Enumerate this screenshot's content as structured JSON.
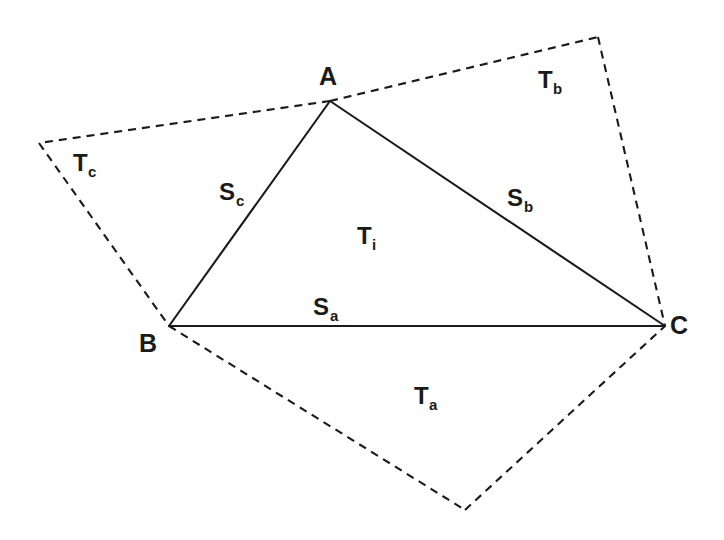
{
  "figure": {
    "background_color": "#ffffff",
    "stroke_color": "#1a1a1a",
    "width": 724,
    "height": 540
  },
  "vertices": [
    {
      "id": "A",
      "label": "A",
      "x": 330,
      "y": 101,
      "label_x": 328,
      "label_y": 85
    },
    {
      "id": "B",
      "label": "B",
      "x": 169,
      "y": 326,
      "label_x": 148,
      "label_y": 352
    },
    {
      "id": "C",
      "label": "C",
      "x": 665,
      "y": 326,
      "label_x": 679,
      "label_y": 334
    }
  ],
  "outer_points": [
    {
      "id": "P_left",
      "x": 39,
      "y": 143
    },
    {
      "id": "P_top_right",
      "x": 598,
      "y": 37
    },
    {
      "id": "P_bottom",
      "x": 465,
      "y": 510
    }
  ],
  "side_labels": [
    {
      "id": "S_a",
      "main": "S",
      "sub": "a",
      "x": 313,
      "y": 315,
      "describes": "edge B to C"
    },
    {
      "id": "S_b",
      "main": "S",
      "sub": "b",
      "x": 507,
      "y": 206,
      "describes": "edge A to C"
    },
    {
      "id": "S_c",
      "main": "S",
      "sub": "c",
      "x": 219,
      "y": 200,
      "describes": "edge A to B"
    }
  ],
  "region_labels": [
    {
      "id": "T_i",
      "main": "T",
      "sub": "i",
      "x": 357,
      "y": 244,
      "describes": "interior triangle ABC"
    },
    {
      "id": "T_a",
      "main": "T",
      "sub": "a",
      "x": 414,
      "y": 404,
      "describes": "exterior region below side a"
    },
    {
      "id": "T_b",
      "main": "T",
      "sub": "b",
      "x": 538,
      "y": 88,
      "describes": "exterior region beyond side b"
    },
    {
      "id": "T_c",
      "main": "T",
      "sub": "c",
      "x": 73,
      "y": 171,
      "describes": "exterior region beyond side c"
    }
  ],
  "solid_paths": [
    {
      "id": "edge-ab",
      "d": "M 330 101 L 169 326"
    },
    {
      "id": "edge-bc",
      "d": "M 169 326 L 665 326"
    },
    {
      "id": "edge-ac",
      "d": "M 330 101 L 665 326"
    }
  ],
  "dashed_paths": [
    {
      "id": "dash-a-left",
      "d": "M 330 101 L 39 143"
    },
    {
      "id": "dash-left-b",
      "d": "M 39 143 L 169 326"
    },
    {
      "id": "dash-a-topright",
      "d": "M 330 101 L 598 37"
    },
    {
      "id": "dash-topright-c",
      "d": "M 598 37 L 665 326"
    },
    {
      "id": "dash-b-bottom",
      "d": "M 169 326 L 465 510"
    },
    {
      "id": "dash-bottom-c",
      "d": "M 465 510 L 665 326"
    }
  ]
}
